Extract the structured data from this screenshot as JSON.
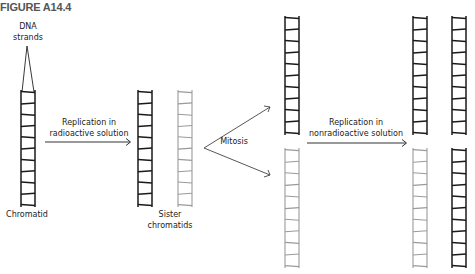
{
  "figure": {
    "title": "FIGURE A14.4"
  },
  "labels": {
    "dna_strands_line1": "DNA",
    "dna_strands_line2": "strands",
    "chromatid": "Chromatid",
    "replication1_line1": "Replication in",
    "replication1_line2": "radioactive solution",
    "sister_line1": "Sister",
    "sister_line2": "chromatids",
    "mitosis": "Mitosis",
    "replication2_line1": "Replication in",
    "replication2_line2": "nonradioactive solution"
  },
  "colors": {
    "dark_strand": "#1a1a1a",
    "radioactive_strand": "#9a9a9a",
    "arrow": "#333333"
  },
  "ladders": [
    {
      "id": "chromatid",
      "x": 21,
      "y": 92,
      "h": 113,
      "shade": "dark"
    },
    {
      "id": "sister-left",
      "x": 138,
      "y": 92,
      "h": 113,
      "shade": "dark"
    },
    {
      "id": "sister-right",
      "x": 178,
      "y": 92,
      "h": 113,
      "shade": "gray"
    },
    {
      "id": "mitosis-top",
      "x": 285,
      "y": 18,
      "h": 115,
      "shade": "dark"
    },
    {
      "id": "mitosis-bottom",
      "x": 285,
      "y": 150,
      "h": 116,
      "shade": "gray"
    },
    {
      "id": "final-top-left",
      "x": 413,
      "y": 18,
      "h": 115,
      "shade": "dark"
    },
    {
      "id": "final-top-right",
      "x": 452,
      "y": 18,
      "h": 115,
      "shade": "dark"
    },
    {
      "id": "final-bottom-left",
      "x": 413,
      "y": 150,
      "h": 116,
      "shade": "gray"
    },
    {
      "id": "final-bottom-right",
      "x": 452,
      "y": 150,
      "h": 116,
      "shade": "dark"
    }
  ]
}
